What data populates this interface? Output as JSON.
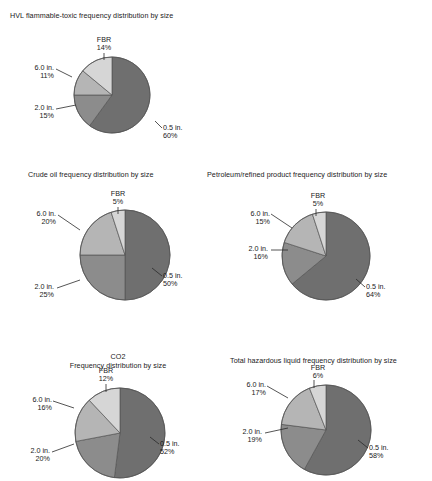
{
  "figure": {
    "background": "#ffffff",
    "slice_colors": {
      "0.5 in.": "#6f6f6f",
      "2.0 in.": "#8c8c8c",
      "6.0 in.": "#b5b5b5",
      "FBR": "#d6d6d6"
    },
    "stroke": "#555555"
  },
  "chart_data": [
    {
      "id": "hvl",
      "type": "pie",
      "title": "HVL flammable-toxic frequency distribution by size",
      "title_lines": [
        "HVL flammable-toxic frequency distribution by size"
      ],
      "labels": [
        "0.5 in.",
        "2.0 in.",
        "6.0 in.",
        "FBR"
      ],
      "values": [
        60,
        15,
        11,
        14
      ],
      "value_labels": [
        "60%",
        "15%",
        "11%",
        "14%"
      ],
      "units": "percent",
      "legend": "none",
      "start_angle_deg": 0,
      "direction": "clockwise"
    },
    {
      "id": "crude",
      "type": "pie",
      "title": "Crude oil frequency distribution by size",
      "title_lines": [
        "Crude oil frequency distribution by size"
      ],
      "labels": [
        "0.5 in.",
        "2.0 in.",
        "6.0 in.",
        "FBR"
      ],
      "values": [
        50,
        25,
        20,
        5
      ],
      "value_labels": [
        "50%",
        "25%",
        "20%",
        "5%"
      ],
      "units": "percent",
      "legend": "none",
      "start_angle_deg": 0,
      "direction": "clockwise"
    },
    {
      "id": "petroleum",
      "type": "pie",
      "title": "Petroleum/refined product frequency distribution by size",
      "title_lines": [
        "Petroleum/refined product frequency distribution by size"
      ],
      "labels": [
        "0.5 in.",
        "2.0 in.",
        "6.0 in.",
        "FBR"
      ],
      "values": [
        64,
        16,
        15,
        5
      ],
      "value_labels": [
        "64%",
        "16%",
        "15%",
        "5%"
      ],
      "units": "percent",
      "legend": "none",
      "start_angle_deg": 0,
      "direction": "clockwise"
    },
    {
      "id": "co2",
      "type": "pie",
      "title": "CO2 Frequency distribution by size",
      "title_lines": [
        "CO2",
        "Frequency distribution by size"
      ],
      "labels": [
        "0.5 in.",
        "2.0 in.",
        "6.0 in.",
        "FBR"
      ],
      "values": [
        52,
        20,
        16,
        12
      ],
      "value_labels": [
        "52%",
        "20%",
        "16%",
        "12%"
      ],
      "units": "percent",
      "legend": "none",
      "start_angle_deg": 0,
      "direction": "clockwise"
    },
    {
      "id": "total",
      "type": "pie",
      "title": "Total hazardous liquid frequency distribution by size",
      "title_lines": [
        "Total hazardous liquid frequency distribution by size"
      ],
      "labels": [
        "0.5 in.",
        "2.0 in.",
        "6.0 in.",
        "FBR"
      ],
      "values": [
        58,
        19,
        17,
        6
      ],
      "value_labels": [
        "58%",
        "19%",
        "17%",
        "6%"
      ],
      "units": "percent",
      "legend": "none",
      "start_angle_deg": 0,
      "direction": "clockwise"
    }
  ]
}
